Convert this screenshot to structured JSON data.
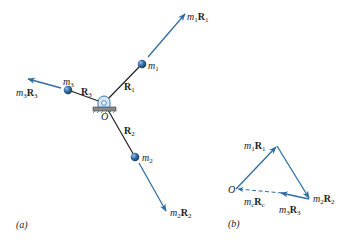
{
  "figure": {
    "panel_a": {
      "caption": "(a)",
      "pivot_label": "O",
      "masses": [
        {
          "name": "m",
          "sub": "1",
          "rod_label": "R",
          "rod_sub": "1",
          "momentum_label_m": "m",
          "momentum_label_msub": "1",
          "momentum_label_R": "R",
          "momentum_label_Rsub": "1"
        },
        {
          "name": "m",
          "sub": "2",
          "rod_label": "R",
          "rod_sub": "2",
          "momentum_label_m": "m",
          "momentum_label_msub": "2",
          "momentum_label_R": "R",
          "momentum_label_Rsub": "2"
        },
        {
          "name": "m",
          "sub": "3",
          "rod_label": "R",
          "rod_sub": "3",
          "momentum_label_m": "m",
          "momentum_label_msub": "3",
          "momentum_label_R": "R",
          "momentum_label_Rsub": "3"
        }
      ]
    },
    "panel_b": {
      "caption": "(b)",
      "origin_label": "O",
      "vectors": [
        {
          "m": "m",
          "msub": "1",
          "R": "R",
          "Rsub": "1"
        },
        {
          "m": "m",
          "msub": "2",
          "R": "R",
          "Rsub": "2"
        },
        {
          "m": "m",
          "msub": "3",
          "R": "R",
          "Rsub": "3"
        },
        {
          "m": "m",
          "msub": "c",
          "R": "R",
          "Rsub": "c"
        }
      ]
    },
    "colors": {
      "arrow": "#2e6da4",
      "rod": "#222222",
      "ball": "#3a6fa8",
      "text": "#222222"
    }
  }
}
